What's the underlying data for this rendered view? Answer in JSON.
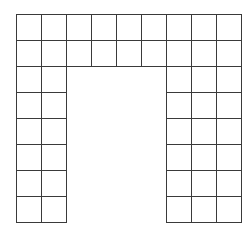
{
  "diagram": {
    "type": "grid-shape",
    "origin": {
      "x": 16,
      "y": 14
    },
    "cell": {
      "w": 25,
      "h": 26
    },
    "columns": 9,
    "rows": 8,
    "line_color": "#3a3a3a",
    "regions": [
      {
        "name": "top-band",
        "col_start": 0,
        "col_end": 8,
        "row_start": 0,
        "row_end": 1
      },
      {
        "name": "left-leg",
        "col_start": 0,
        "col_end": 1,
        "row_start": 2,
        "row_end": 7
      },
      {
        "name": "right-leg",
        "col_start": 6,
        "col_end": 8,
        "row_start": 2,
        "row_end": 7
      }
    ],
    "cell_count": 48
  }
}
